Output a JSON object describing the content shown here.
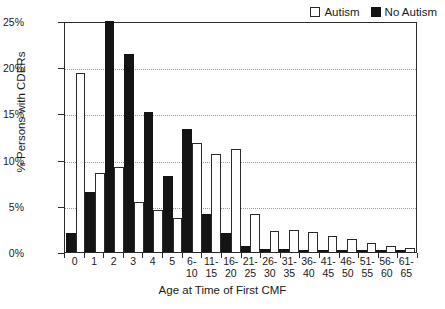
{
  "chart_data": {
    "type": "bar",
    "title": "",
    "xlabel": "Age at Time of First CMF",
    "ylabel": "% Persons with CDERs",
    "ylim": [
      0,
      25
    ],
    "yticks": [
      "0%",
      "5%",
      "10%",
      "15%",
      "20%",
      "25%"
    ],
    "ytick_values": [
      0,
      5,
      10,
      15,
      20,
      25
    ],
    "grid": true,
    "legend_position": "top-right",
    "categories": [
      "0",
      "1",
      "2",
      "3",
      "4",
      "5",
      "6-\n10",
      "11-\n15",
      "16-\n20",
      "21-\n25",
      "26-\n30",
      "31-\n35",
      "36-\n40",
      "41-\n45",
      "46-\n50",
      "51-\n55",
      "56-\n60",
      "61-\n65"
    ],
    "series": [
      {
        "name": "No Autism",
        "color": "#141414",
        "values": [
          2.1,
          6.5,
          25.0,
          21.4,
          15.2,
          8.2,
          13.3,
          4.1,
          2.1,
          0.7,
          0.3,
          0.3,
          0.25,
          0.2,
          0.15,
          0.15,
          0.15,
          0.1
        ]
      },
      {
        "name": "Autism",
        "color": "#ffffff",
        "values": [
          19.4,
          8.6,
          9.2,
          5.4,
          4.5,
          3.7,
          11.8,
          10.6,
          11.2,
          4.1,
          2.3,
          2.4,
          2.2,
          1.7,
          1.4,
          1.0,
          0.6,
          0.45
        ]
      }
    ]
  },
  "legend": {
    "items": [
      {
        "label": "Autism",
        "swatch": "autism"
      },
      {
        "label": "No Autism",
        "swatch": "noautism"
      }
    ]
  }
}
